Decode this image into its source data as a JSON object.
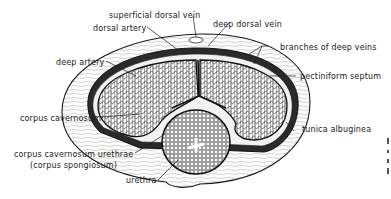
{
  "figure": {
    "type": "anatomical cross-section",
    "labels": {
      "superficial_dorsal_vein": "superficial dorsal vein",
      "dorsal_artery": "dorsal artery",
      "deep_dorsal_vein": "deep dorsal vein",
      "branches_of_deep_veins": "branches of deep veins",
      "deep_artery": "deep artery",
      "pectiniform_septum": "pectiniform septum",
      "corpus_cavernosum": "corpus cavernosum",
      "tunica_albuginea": "tunica albuginea",
      "corpus_cavernosum_urethrae": "corpus cavernosum urethrae",
      "corpus_spongiosum": "(corpus spongiosum)",
      "urethra": "urethra"
    },
    "colors": {
      "ink": "#1a1a1a",
      "background": "#ffffff"
    }
  }
}
